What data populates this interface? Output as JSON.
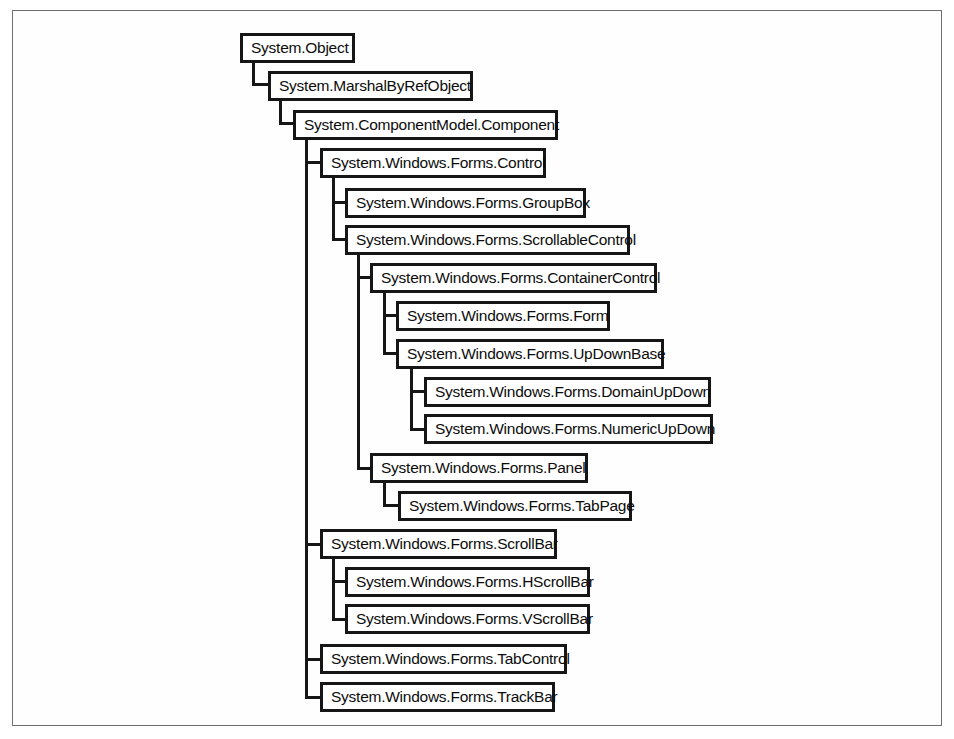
{
  "diagram": {
    "type": "class-hierarchy-tree",
    "title": "",
    "orientation": "top-down-indented",
    "colors": {
      "node_border": "#161616",
      "node_fill": "#ffffff",
      "edge": "#161616",
      "frame_border": "#6e6e6e",
      "page_background": "#ffffff",
      "text": "#0c0c0c"
    },
    "nodes": [
      {
        "id": "object",
        "label": "System.Object",
        "x": 240,
        "y": 33,
        "w": 115,
        "h": 30,
        "depth": 0
      },
      {
        "id": "marshal",
        "label": "System.MarshalByRefObject",
        "x": 268,
        "y": 71,
        "w": 205,
        "h": 30,
        "depth": 1
      },
      {
        "id": "component",
        "label": "System.ComponentModel.Component",
        "x": 293,
        "y": 110,
        "w": 265,
        "h": 30,
        "depth": 2
      },
      {
        "id": "control",
        "label": "System.Windows.Forms.Control",
        "x": 320,
        "y": 148,
        "w": 226,
        "h": 30,
        "depth": 3
      },
      {
        "id": "groupbox",
        "label": "System.Windows.Forms.GroupBox",
        "x": 345,
        "y": 188,
        "w": 241,
        "h": 30,
        "depth": 4
      },
      {
        "id": "scrollablecontrol",
        "label": "System.Windows.Forms.ScrollableControl",
        "x": 345,
        "y": 225,
        "w": 285,
        "h": 30,
        "depth": 4
      },
      {
        "id": "containercontrol",
        "label": "System.Windows.Forms.ContainerControl",
        "x": 370,
        "y": 263,
        "w": 287,
        "h": 30,
        "depth": 5
      },
      {
        "id": "form",
        "label": "System.Windows.Forms.Form",
        "x": 396,
        "y": 301,
        "w": 214,
        "h": 30,
        "depth": 6
      },
      {
        "id": "updownbase",
        "label": "System.Windows.Forms.UpDownBase",
        "x": 396,
        "y": 339,
        "w": 268,
        "h": 30,
        "depth": 6
      },
      {
        "id": "domainupdown",
        "label": "System.Windows.Forms.DomainUpDown",
        "x": 424,
        "y": 377,
        "w": 287,
        "h": 30,
        "depth": 7
      },
      {
        "id": "numericupdown",
        "label": "System.Windows.Forms.NumericUpDown",
        "x": 424,
        "y": 414,
        "w": 289,
        "h": 30,
        "depth": 7
      },
      {
        "id": "panel",
        "label": "System.Windows.Forms.Panel",
        "x": 370,
        "y": 453,
        "w": 218,
        "h": 30,
        "depth": 5
      },
      {
        "id": "tabpage",
        "label": "System.Windows.Forms.TabPage",
        "x": 398,
        "y": 491,
        "w": 234,
        "h": 30,
        "depth": 6
      },
      {
        "id": "scrollbar",
        "label": "System.Windows.Forms.ScrollBar",
        "x": 320,
        "y": 529,
        "w": 237,
        "h": 30,
        "depth": 3
      },
      {
        "id": "hscrollbar",
        "label": "System.Windows.Forms.HScrollBar",
        "x": 345,
        "y": 567,
        "w": 245,
        "h": 30,
        "depth": 4
      },
      {
        "id": "vscrollbar",
        "label": "System.Windows.Forms.VScrollBar",
        "x": 345,
        "y": 604,
        "w": 245,
        "h": 30,
        "depth": 4
      },
      {
        "id": "tabcontrol",
        "label": "System.Windows.Forms.TabControl",
        "x": 320,
        "y": 644,
        "w": 247,
        "h": 30,
        "depth": 3
      },
      {
        "id": "trackbar",
        "label": "System.Windows.Forms.TrackBar",
        "x": 320,
        "y": 682,
        "w": 235,
        "h": 30,
        "depth": 3
      }
    ],
    "edges": [
      {
        "id": "object-marshal",
        "from": "object",
        "to": "marshal",
        "vx": 252,
        "vy": 63,
        "vh": 23,
        "hx": 252,
        "hy": 83,
        "hw": 19
      },
      {
        "id": "marshal-component",
        "from": "marshal",
        "to": "component",
        "vx": 279,
        "vy": 101,
        "vh": 23,
        "hx": 279,
        "hy": 122,
        "hw": 17
      },
      {
        "id": "component-trunk",
        "from": "component",
        "to": "trackbar",
        "vx": 305,
        "vy": 140,
        "vh": 557,
        "hx": 0,
        "hy": 0,
        "hw": 0
      },
      {
        "id": "component-control",
        "from": "component",
        "to": "control",
        "vx": 0,
        "vy": 0,
        "vh": 0,
        "hx": 305,
        "hy": 161,
        "hw": 18
      },
      {
        "id": "component-scrollbar",
        "from": "component",
        "to": "scrollbar",
        "vx": 0,
        "vy": 0,
        "vh": 0,
        "hx": 305,
        "hy": 543,
        "hw": 18
      },
      {
        "id": "component-tabcontrol",
        "from": "component",
        "to": "tabcontrol",
        "vx": 0,
        "vy": 0,
        "vh": 0,
        "hx": 305,
        "hy": 658,
        "hw": 18
      },
      {
        "id": "component-trackbar",
        "from": "component",
        "to": "trackbar",
        "vx": 0,
        "vy": 0,
        "vh": 0,
        "hx": 305,
        "hy": 696,
        "hw": 18
      },
      {
        "id": "control-trunk",
        "from": "control",
        "to": "scrollablecontrol",
        "vx": 332,
        "vy": 178,
        "vh": 62,
        "hx": 0,
        "hy": 0,
        "hw": 0
      },
      {
        "id": "control-groupbox",
        "from": "control",
        "to": "groupbox",
        "vx": 0,
        "vy": 0,
        "vh": 0,
        "hx": 332,
        "hy": 201,
        "hw": 16
      },
      {
        "id": "control-scrollablecontrol",
        "from": "control",
        "to": "scrollablecontrol",
        "vx": 0,
        "vy": 0,
        "vh": 0,
        "hx": 332,
        "hy": 238,
        "hw": 16
      },
      {
        "id": "scrollable-trunk",
        "from": "scrollablecontrol",
        "to": "panel",
        "vx": 357,
        "vy": 255,
        "vh": 213,
        "hx": 0,
        "hy": 0,
        "hw": 0
      },
      {
        "id": "scrollable-containercontrol",
        "from": "scrollablecontrol",
        "to": "containercontrol",
        "vx": 0,
        "vy": 0,
        "vh": 0,
        "hx": 357,
        "hy": 276,
        "hw": 16
      },
      {
        "id": "scrollable-panel",
        "from": "scrollablecontrol",
        "to": "panel",
        "vx": 0,
        "vy": 0,
        "vh": 0,
        "hx": 357,
        "hy": 467,
        "hw": 16
      },
      {
        "id": "container-trunk",
        "from": "containercontrol",
        "to": "updownbase",
        "vx": 383,
        "vy": 293,
        "vh": 61,
        "hx": 0,
        "hy": 0,
        "hw": 0
      },
      {
        "id": "container-form",
        "from": "containercontrol",
        "to": "form",
        "vx": 0,
        "vy": 0,
        "vh": 0,
        "hx": 383,
        "hy": 314,
        "hw": 16
      },
      {
        "id": "container-updownbase",
        "from": "containercontrol",
        "to": "updownbase",
        "vx": 0,
        "vy": 0,
        "vh": 0,
        "hx": 383,
        "hy": 352,
        "hw": 16
      },
      {
        "id": "updownbase-trunk",
        "from": "updownbase",
        "to": "numericupdown",
        "vx": 410,
        "vy": 369,
        "vh": 61,
        "hx": 0,
        "hy": 0,
        "hw": 0
      },
      {
        "id": "updownbase-domainupdown",
        "from": "updownbase",
        "to": "domainupdown",
        "vx": 0,
        "vy": 0,
        "vh": 0,
        "hx": 410,
        "hy": 390,
        "hw": 16
      },
      {
        "id": "updownbase-numericupdown",
        "from": "updownbase",
        "to": "numericupdown",
        "vx": 0,
        "vy": 0,
        "vh": 0,
        "hx": 410,
        "hy": 428,
        "hw": 16
      },
      {
        "id": "panel-trunk",
        "from": "panel",
        "to": "tabpage",
        "vx": 383,
        "vy": 483,
        "vh": 24,
        "hx": 0,
        "hy": 0,
        "hw": 0
      },
      {
        "id": "panel-tabpage",
        "from": "panel",
        "to": "tabpage",
        "vx": 0,
        "vy": 0,
        "vh": 0,
        "hx": 383,
        "hy": 504,
        "hw": 18
      },
      {
        "id": "scrollbar-trunk",
        "from": "scrollbar",
        "to": "vscrollbar",
        "vx": 332,
        "vy": 559,
        "vh": 61,
        "hx": 0,
        "hy": 0,
        "hw": 0
      },
      {
        "id": "scrollbar-hscrollbar",
        "from": "scrollbar",
        "to": "hscrollbar",
        "vx": 0,
        "vy": 0,
        "vh": 0,
        "hx": 332,
        "hy": 580,
        "hw": 16
      },
      {
        "id": "scrollbar-vscrollbar",
        "from": "scrollbar",
        "to": "vscrollbar",
        "vx": 0,
        "vy": 0,
        "vh": 0,
        "hx": 332,
        "hy": 618,
        "hw": 16
      }
    ]
  }
}
